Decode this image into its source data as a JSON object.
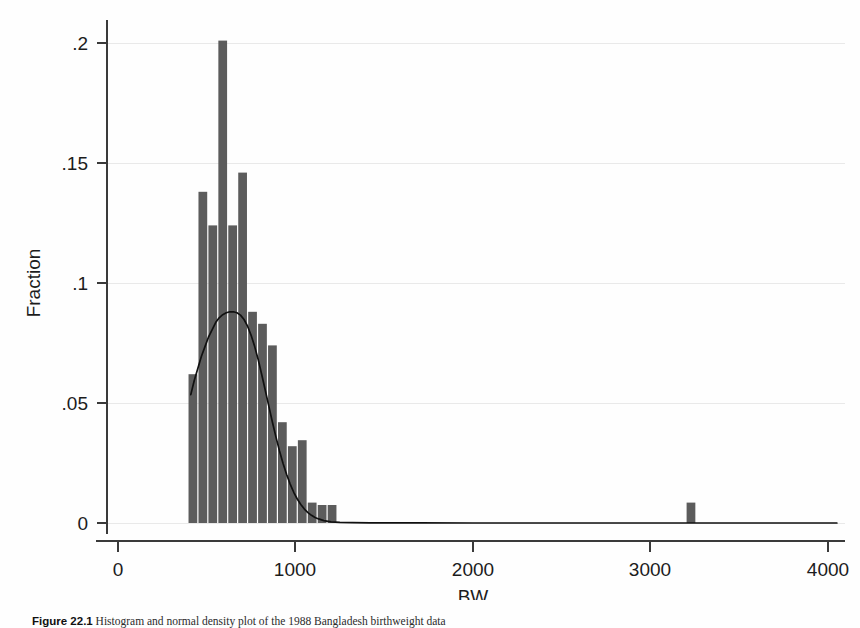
{
  "figure": {
    "caption_label": "Figure 22.1",
    "caption_text": "Histogram and normal density plot of the 1988 Bangladesh birthweight data"
  },
  "chart_data": {
    "type": "bar",
    "title": "",
    "subtitle": "",
    "xlabel": "BW",
    "ylabel": "Fraction",
    "xlim": [
      0,
      4100
    ],
    "ylim": [
      0,
      0.215
    ],
    "xticks": [
      0,
      1000,
      2000,
      3000,
      4000
    ],
    "xticklabels": [
      "0",
      "1000",
      "2000",
      "3000",
      "4000"
    ],
    "yticks": [
      0,
      0.05,
      0.1,
      0.15,
      0.2
    ],
    "yticklabels": [
      "0",
      ".05",
      ".1",
      ".15",
      ".2"
    ],
    "grid": "horizontal",
    "legend": "none",
    "bar_color": "#5c5c5c",
    "curve_color": "#101010",
    "bin_width": 56,
    "bars": [
      {
        "x": 394,
        "value": 0.062
      },
      {
        "x": 450,
        "value": 0.138
      },
      {
        "x": 506,
        "value": 0.124
      },
      {
        "x": 562,
        "value": 0.201
      },
      {
        "x": 618,
        "value": 0.124
      },
      {
        "x": 674,
        "value": 0.146
      },
      {
        "x": 730,
        "value": 0.088
      },
      {
        "x": 786,
        "value": 0.083
      },
      {
        "x": 842,
        "value": 0.074
      },
      {
        "x": 898,
        "value": 0.042
      },
      {
        "x": 954,
        "value": 0.032
      },
      {
        "x": 1010,
        "value": 0.0345
      },
      {
        "x": 1066,
        "value": 0.0085
      },
      {
        "x": 1122,
        "value": 0.0075
      },
      {
        "x": 1178,
        "value": 0.0075
      },
      {
        "x": 3200,
        "value": 0.0085
      }
    ],
    "curve": {
      "name": "normal density",
      "mean": 670,
      "peak_value": 0.088,
      "x_start": 410,
      "x_end": 4050,
      "points": [
        [
          410,
          0.0535
        ],
        [
          430,
          0.0595
        ],
        [
          450,
          0.0645
        ],
        [
          470,
          0.0695
        ],
        [
          490,
          0.0735
        ],
        [
          510,
          0.0775
        ],
        [
          530,
          0.0805
        ],
        [
          550,
          0.0835
        ],
        [
          570,
          0.0855
        ],
        [
          590,
          0.0868
        ],
        [
          610,
          0.0876
        ],
        [
          630,
          0.088
        ],
        [
          650,
          0.088
        ],
        [
          670,
          0.0876
        ],
        [
          690,
          0.0866
        ],
        [
          710,
          0.0848
        ],
        [
          730,
          0.082
        ],
        [
          750,
          0.0782
        ],
        [
          770,
          0.0735
        ],
        [
          790,
          0.068
        ],
        [
          810,
          0.0618
        ],
        [
          830,
          0.0552
        ],
        [
          850,
          0.0486
        ],
        [
          870,
          0.042
        ],
        [
          890,
          0.0358
        ],
        [
          910,
          0.03
        ],
        [
          930,
          0.0248
        ],
        [
          950,
          0.0202
        ],
        [
          970,
          0.0162
        ],
        [
          990,
          0.0128
        ],
        [
          1010,
          0.01
        ],
        [
          1030,
          0.0077
        ],
        [
          1050,
          0.0058
        ],
        [
          1070,
          0.0043
        ],
        [
          1090,
          0.0032
        ],
        [
          1110,
          0.0023
        ],
        [
          1130,
          0.0017
        ],
        [
          1160,
          0.001
        ],
        [
          1200,
          0.0005
        ],
        [
          1250,
          0.0003
        ],
        [
          1320,
          0.00014
        ],
        [
          1420,
          6e-05
        ],
        [
          1550,
          3e-05
        ],
        [
          1700,
          2e-05
        ],
        [
          2000,
          1e-05
        ],
        [
          2500,
          1e-05
        ],
        [
          3200,
          1e-05
        ],
        [
          4050,
          1e-05
        ]
      ]
    }
  }
}
